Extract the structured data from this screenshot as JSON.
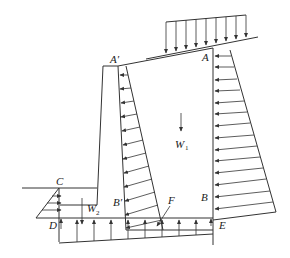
{
  "diagram": {
    "type": "retaining-wall-force-diagram",
    "labels": {
      "A": "A",
      "A_prime": "A′",
      "B": "B",
      "B_prime": "B′",
      "C": "C",
      "D": "D",
      "E": "E",
      "F": "F",
      "W1": "W",
      "W1_sub": "1",
      "W2": "W",
      "W2_sub": "2"
    },
    "elements": [
      "surcharge-load-distributed-downward",
      "active-earth-pressure-right-side-trapezoid",
      "earth-pressure-inner-wall-trapezoid",
      "passive-pressure-front-triangle",
      "uplift-pressure-base",
      "self-weight-W1",
      "self-weight-W2",
      "base-reaction-F"
    ],
    "colors": {
      "line": "#333333",
      "background": "#ffffff"
    }
  }
}
